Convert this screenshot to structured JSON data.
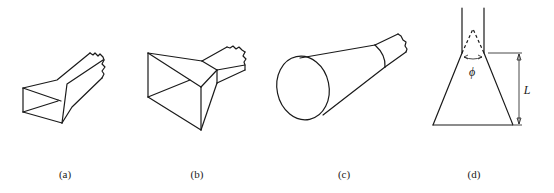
{
  "figure": {
    "panels": [
      {
        "id": "a",
        "label": "(a)",
        "description": "E-plane sectoral horn"
      },
      {
        "id": "b",
        "label": "(b)",
        "description": "Pyramidal horn"
      },
      {
        "id": "c",
        "label": "(c)",
        "description": "Conical horn"
      },
      {
        "id": "d",
        "label": "(d)",
        "description": "Horn cross-section with flare angle and length"
      }
    ],
    "annotations": {
      "flare_angle_symbol": "ϕ",
      "length_symbol": "L"
    },
    "colors": {
      "line": "#1a1a1a",
      "background": "#ffffff"
    }
  }
}
